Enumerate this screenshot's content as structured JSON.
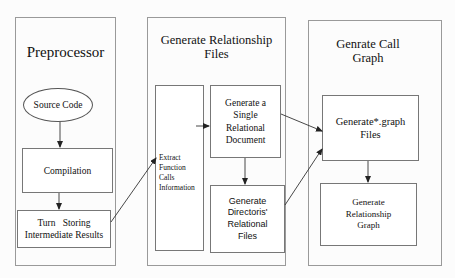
{
  "panels": {
    "preprocessor": {
      "title": "Preprocessor",
      "nodes": {
        "source_code": "Source Code",
        "compilation": "Compilation",
        "turn_storing_line1": "Turn   Storing",
        "turn_storing_line2": "Intermediate Results"
      }
    },
    "relationship": {
      "title_line1": "Generate Relationship",
      "title_line2": "Files",
      "nodes": {
        "extract_l1": "Extract",
        "extract_l2": "Function",
        "extract_l3": "Calls",
        "extract_l4": "Information",
        "single_l1": "Generate a",
        "single_l2": "Single",
        "single_l3": "Relational",
        "single_l4": "Document",
        "dir_l1": "Generate",
        "dir_l2": "Directoris'",
        "dir_l3": "Relational",
        "dir_l4": "Files"
      }
    },
    "callgraph": {
      "title_line1": "Genrate Call",
      "title_line2": "Graph",
      "nodes": {
        "graph_files_l1": "Generate*.graph",
        "graph_files_l2": "Files",
        "rel_graph_l1": "Generate",
        "rel_graph_l2": "Relationship",
        "rel_graph_l3": "Graph"
      }
    }
  },
  "colors": {
    "panel_border": "#9a9a9a",
    "box_border": "#777777",
    "arrow": "#222222"
  }
}
